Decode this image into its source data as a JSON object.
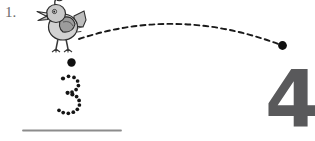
{
  "worksheet": {
    "item_label": "1.",
    "target_numeral": "4",
    "trace_numeral": "3",
    "instruction_kind": "trace-the-number",
    "colors": {
      "page_background": "#ffffff",
      "numeral_gray": "#59595b",
      "item_label_gray": "#6b6b6b",
      "baseline_gray": "#8c8c8c",
      "dot_black": "#151515",
      "dash_black": "#1a1a1a",
      "bird_outline": "#2b2b2b",
      "bird_body_light": "#d9d9d9",
      "bird_body_mid": "#b4b4b4",
      "bird_body_dark": "#8e8e8e",
      "bird_wing": "#9b9b9b"
    }
  },
  "figures": {
    "bird": {
      "name": "cartoon-bird",
      "x": 38,
      "y": 0,
      "width": 46,
      "height": 52,
      "parts": [
        "crest",
        "head",
        "eye",
        "beak",
        "body",
        "wing",
        "tail",
        "legs",
        "feet"
      ]
    },
    "start_dot": {
      "name": "trace-start-dot",
      "cx": 71.5,
      "cy": 62.5,
      "r": 4.2
    },
    "arc_end_dot": {
      "name": "flight-path-end-dot",
      "cx": 282.5,
      "cy": 45.5,
      "r": 4.4
    },
    "flight_path": {
      "name": "dashed-flight-arc",
      "start": [
        79,
        39
      ],
      "control": [
        178,
        6
      ],
      "end": [
        281,
        45
      ],
      "dash_pattern": "5 4",
      "stroke_width": 1.9
    },
    "baseline": {
      "name": "writing-baseline",
      "x1": 23,
      "y1": 130.5,
      "x2": 121,
      "y2": 130.5,
      "stroke_width": 1.8
    }
  },
  "trace_dots": {
    "name": "dotted-numeral-three",
    "radius_small": 1.85,
    "radius_medium": 2.1,
    "points": [
      [
        63.0,
        78.5
      ],
      [
        68.5,
        76.3
      ],
      [
        74.0,
        77.4
      ],
      [
        77.6,
        81.0
      ],
      [
        78.4,
        85.6
      ],
      [
        76.1,
        89.6
      ],
      [
        72.0,
        92.0
      ],
      [
        67.6,
        92.8
      ],
      [
        72.4,
        94.4
      ],
      [
        76.6,
        96.6
      ],
      [
        79.1,
        100.4
      ],
      [
        79.4,
        105.0
      ],
      [
        77.3,
        109.3
      ],
      [
        73.3,
        112.2
      ],
      [
        68.3,
        113.3
      ],
      [
        63.2,
        112.6
      ],
      [
        59.0,
        110.3
      ]
    ]
  }
}
